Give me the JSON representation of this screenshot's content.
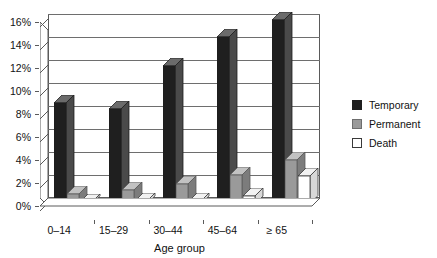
{
  "chart_data": {
    "type": "bar",
    "title": "",
    "subtitle": "",
    "xlabel": "Age group",
    "ylabel": "",
    "categories": [
      "0–14",
      "15–29",
      "30–44",
      "45–64",
      "≥ 65"
    ],
    "series": [
      {
        "name": "Temporary",
        "color": "#1f1f1f",
        "values": [
          8.8,
          8.3,
          12.0,
          14.5,
          16.0
        ]
      },
      {
        "name": "Permanent",
        "color": "#9a9a9a",
        "values": [
          0.9,
          1.2,
          1.7,
          2.5,
          3.8
        ]
      },
      {
        "name": "Death",
        "color": "#ffffff",
        "values": [
          0.15,
          0.25,
          0.25,
          0.7,
          2.4
        ]
      }
    ],
    "ylim": [
      0,
      16
    ],
    "ytick_values": [
      0,
      2,
      4,
      6,
      8,
      10,
      12,
      14,
      16
    ],
    "ytick_labels": [
      "0%",
      "2%",
      "4%",
      "6%",
      "8%",
      "10%",
      "12%",
      "14%",
      "16%"
    ],
    "grid": true,
    "grid_axis": "y",
    "legend_position": "right",
    "value_unit": "%",
    "style": "3d-column"
  },
  "legend": {
    "entries": [
      {
        "label": "Temporary",
        "swatch": "temporary-swatch"
      },
      {
        "label": "Permanent",
        "swatch": "permanent-swatch"
      },
      {
        "label": "Death",
        "swatch": "death-swatch"
      }
    ]
  },
  "colors": {
    "temporary": "#1f1f1f",
    "temporary_side": "#4a4a4a",
    "temporary_top": "#6b6b6b",
    "permanent": "#9a9a9a",
    "permanent_side": "#7c7c7c",
    "permanent_top": "#c2c2c2",
    "death": "#ffffff",
    "death_side": "#d8d8d8",
    "death_top": "#f2f2f2",
    "axis": "#5a5a5a",
    "grid": "#6e6e6e",
    "background": "#ffffff",
    "text": "#111111"
  }
}
